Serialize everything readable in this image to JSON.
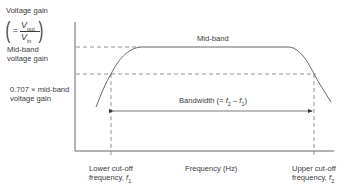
{
  "diagram": {
    "type": "frequency-response-curve",
    "y_axis": {
      "title": "Voltage gain",
      "formula": {
        "equals": "=",
        "numerator_var": "V",
        "numerator_sub": "out",
        "denominator_var": "V",
        "denominator_sub": "in"
      },
      "level_midband": "Mid-band voltage gain",
      "level_midband_line1": "Mid-band",
      "level_midband_line2": "voltage gain",
      "level_cutoff_line1": "0.707 × mid-band",
      "level_cutoff_line2": "voltage gain"
    },
    "x_axis": {
      "title": "Frequency (Hz)",
      "lower_cutoff_line1": "Lower cut-off",
      "lower_cutoff_line2": "frequency, ",
      "lower_cutoff_var": "f",
      "lower_cutoff_sub": "1",
      "upper_cutoff_line1": "Upper cut-off",
      "upper_cutoff_line2": "frequency, ",
      "upper_cutoff_var": "f",
      "upper_cutoff_sub": "2"
    },
    "region_label": "Mid-band",
    "bandwidth": {
      "label_prefix": "Bandwidth (= ",
      "f2": "f",
      "f2_sub": "2",
      "minus": " – ",
      "f1": "f",
      "f1_sub": "1",
      "label_suffix": ")"
    },
    "colors": {
      "line": "#555555",
      "dash": "#777777",
      "text": "#3a3a3a"
    }
  }
}
